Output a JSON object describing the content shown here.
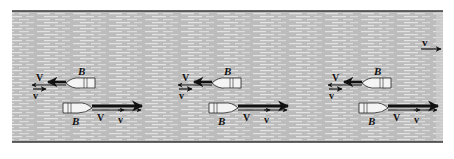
{
  "figure": {
    "colors": {
      "water": "#bcbcbc",
      "water_dash": "#e4e4e4",
      "bank": "#333333",
      "boat_fill": "#f4f4f4",
      "ink": "#111111"
    },
    "current": {
      "label": "v",
      "direction": "right"
    },
    "frames": [
      {
        "upstream": {
          "boat_label": "B",
          "boat_velocity_label": "V",
          "current_label": "v"
        },
        "downstream": {
          "boat_label": "B",
          "boat_velocity_label": "V",
          "current_label": "v"
        }
      },
      {
        "upstream": {
          "boat_label": "B",
          "boat_velocity_label": "V",
          "current_label": "v"
        },
        "downstream": {
          "boat_label": "B",
          "boat_velocity_label": "V",
          "current_label": "v"
        }
      },
      {
        "upstream": {
          "boat_label": "B",
          "boat_velocity_label": "V",
          "current_label": "v"
        },
        "downstream": {
          "boat_label": "B",
          "boat_velocity_label": "V",
          "current_label": "v"
        }
      }
    ]
  }
}
